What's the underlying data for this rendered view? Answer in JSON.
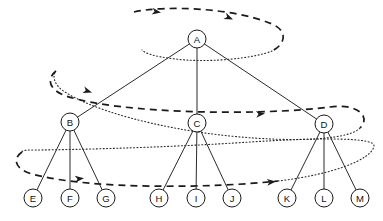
{
  "figure": {
    "background_color": "#ffffff",
    "line_color": "#1a1a1a",
    "node_fill": "#ffffff",
    "width": 383,
    "height": 221
  },
  "tree": {
    "node_radius": 9,
    "nodes": [
      {
        "id": "A",
        "label": "A",
        "x": 197,
        "y": 39,
        "level": 0
      },
      {
        "id": "B",
        "label": "B",
        "x": 70,
        "y": 122,
        "level": 1
      },
      {
        "id": "C",
        "label": "C",
        "x": 197,
        "y": 123,
        "level": 1
      },
      {
        "id": "D",
        "label": "D",
        "x": 324,
        "y": 124,
        "level": 1
      },
      {
        "id": "E",
        "label": "E",
        "x": 33,
        "y": 198,
        "level": 2
      },
      {
        "id": "F",
        "label": "F",
        "x": 70,
        "y": 198,
        "level": 2
      },
      {
        "id": "G",
        "label": "G",
        "x": 106,
        "y": 198,
        "level": 2
      },
      {
        "id": "H",
        "label": "H",
        "x": 159,
        "y": 198,
        "level": 2
      },
      {
        "id": "I",
        "label": "I",
        "x": 196,
        "y": 198,
        "level": 2
      },
      {
        "id": "J",
        "label": "J",
        "x": 232,
        "y": 198,
        "level": 2
      },
      {
        "id": "K",
        "label": "K",
        "x": 287,
        "y": 198,
        "level": 2
      },
      {
        "id": "L",
        "label": "L",
        "x": 324,
        "y": 198,
        "level": 2
      },
      {
        "id": "M",
        "label": "M",
        "x": 360,
        "y": 198,
        "level": 2
      }
    ],
    "edges": [
      {
        "from": "A",
        "to": "B"
      },
      {
        "from": "A",
        "to": "C"
      },
      {
        "from": "A",
        "to": "D"
      },
      {
        "from": "B",
        "to": "E"
      },
      {
        "from": "B",
        "to": "F"
      },
      {
        "from": "B",
        "to": "G"
      },
      {
        "from": "C",
        "to": "H"
      },
      {
        "from": "C",
        "to": "I"
      },
      {
        "from": "C",
        "to": "J"
      },
      {
        "from": "D",
        "to": "K"
      },
      {
        "from": "D",
        "to": "L"
      },
      {
        "from": "D",
        "to": "M"
      }
    ]
  },
  "spiral": {
    "style_dashed": "dashed",
    "style_dotted": "dotted",
    "description": "Three dashed-and-dotted elliptical loops sweeping left-to-right across each tree level, indicating spiral (level-order zigzag) traversal",
    "loops": [
      {
        "name": "loop-level-0",
        "dashed_path": "M 134 12 C 165 5, 235 8, 272 24 C 288 31, 286 44, 272 51",
        "dotted_path": "M 272 51 C 255 58, 215 62, 186 60 C 160 58, 145 54, 142 50",
        "arrows": [
          {
            "x": 161,
            "y": 12.6,
            "angle": 9
          },
          {
            "x": 233,
            "y": 19.6,
            "angle": 24
          }
        ]
      },
      {
        "name": "loop-level-1",
        "dashed_path": "M 56 71 C 46 79, 49 90, 66 96 C 120 114, 260 116, 330 107 C 356 103, 372 116, 360 128",
        "dotted_path": "M 360 128 C 350 139, 300 143, 230 136 C 160 129, 90 110, 62 90 C 54 84, 52 75, 56 71",
        "arrows": [
          {
            "x": 92,
            "y": 92.5,
            "angle": 17
          },
          {
            "x": 265,
            "y": 113.5,
            "angle": -5
          }
        ]
      },
      {
        "name": "loop-level-2",
        "dashed_path": "M 22 152 C 12 159, 15 169, 32 174 C 90 190, 215 188, 278 181",
        "dotted_path": "M 278 181 C 330 175, 372 160, 374 146 C 375 138, 330 137, 250 142 C 160 148, 60 150, 30 150 C 24 150, 22 151, 22 152",
        "arrows": [
          {
            "x": 84,
            "y": 178.3,
            "angle": -6
          },
          {
            "x": 276,
            "y": 181.4,
            "angle": -6
          }
        ]
      }
    ]
  }
}
